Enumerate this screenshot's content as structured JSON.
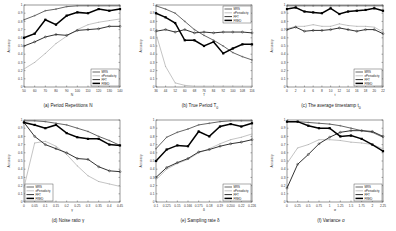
{
  "figure": {
    "legend": [
      "MRS",
      "ePeriodicity",
      "FFT",
      "FRED"
    ],
    "ylabel": "Accuracy"
  },
  "series_styles": [
    {
      "name": "MRS",
      "color": "#555555",
      "width": 0.9,
      "marker": "plus"
    },
    {
      "name": "ePeriodicity",
      "color": "#aaaaaa",
      "width": 0.7,
      "marker": "dot"
    },
    {
      "name": "FFT",
      "color": "#333333",
      "width": 1.0,
      "marker": "circle"
    },
    {
      "name": "FRED",
      "color": "#000000",
      "width": 1.5,
      "marker": "square"
    }
  ],
  "chart_data": [
    {
      "type": "line",
      "title": "(a) Period Repetitions N",
      "xlabel": "N",
      "ylabel": "Accuracy",
      "ylim": [
        0,
        1
      ],
      "legend_position": "lower right",
      "x": [
        50,
        60,
        70,
        80,
        90,
        100,
        110,
        120,
        130,
        140
      ],
      "series": [
        {
          "name": "MRS",
          "values": [
            0.82,
            0.87,
            0.93,
            0.95,
            0.98,
            0.99,
            0.99,
            0.99,
            0.99,
            0.99
          ]
        },
        {
          "name": "ePeriodicity",
          "values": [
            0.22,
            0.3,
            0.41,
            0.53,
            0.62,
            0.7,
            0.76,
            0.79,
            0.81,
            0.83
          ]
        },
        {
          "name": "FFT",
          "values": [
            0.5,
            0.55,
            0.61,
            0.64,
            0.63,
            0.69,
            0.7,
            0.71,
            0.74,
            0.74
          ]
        },
        {
          "name": "FRED",
          "values": [
            0.6,
            0.65,
            0.82,
            0.76,
            0.87,
            0.91,
            0.9,
            0.95,
            0.93,
            0.95
          ]
        }
      ]
    },
    {
      "type": "line",
      "title": "(b) True Period T",
      "title_subscript": "0",
      "xlabel": "T",
      "ylabel": "Accuracy",
      "ylim": [
        0,
        1
      ],
      "legend_position": "upper right",
      "x": [
        36,
        44,
        52,
        60,
        68,
        76,
        84,
        92,
        100,
        108,
        116
      ],
      "series": [
        {
          "name": "MRS",
          "values": [
            0.99,
            0.95,
            0.9,
            0.8,
            0.7,
            0.63,
            0.57,
            0.5,
            0.42,
            0.37,
            0.33
          ]
        },
        {
          "name": "ePeriodicity",
          "values": [
            0.65,
            0.25,
            0.05,
            0.02,
            0.01,
            0.01,
            0.01,
            0.01,
            0.01,
            0.01,
            0.01
          ]
        },
        {
          "name": "FFT",
          "values": [
            0.68,
            0.7,
            0.67,
            0.7,
            0.66,
            0.67,
            0.66,
            0.67,
            0.67,
            0.67,
            0.66
          ]
        },
        {
          "name": "FRED",
          "values": [
            0.9,
            0.85,
            0.78,
            0.57,
            0.57,
            0.5,
            0.55,
            0.41,
            0.47,
            0.52,
            0.52
          ]
        }
      ]
    },
    {
      "type": "line",
      "title": "(c) The average timestamp t",
      "title_subscript": "0",
      "xlabel": "t",
      "ylabel": "Accuracy",
      "ylim": [
        0,
        1
      ],
      "legend_position": "lower right",
      "x": [
        0,
        2,
        4,
        6,
        8,
        10,
        12,
        14,
        16,
        18,
        20,
        22
      ],
      "series": [
        {
          "name": "MRS",
          "values": [
            0.99,
            0.99,
            0.99,
            0.99,
            0.99,
            0.99,
            0.99,
            0.99,
            0.99,
            0.99,
            0.99,
            0.99
          ]
        },
        {
          "name": "ePeriodicity",
          "values": [
            0.71,
            0.74,
            0.74,
            0.76,
            0.74,
            0.74,
            0.77,
            0.75,
            0.74,
            0.74,
            0.73,
            0.67
          ]
        },
        {
          "name": "FFT",
          "values": [
            0.7,
            0.73,
            0.68,
            0.69,
            0.69,
            0.7,
            0.72,
            0.7,
            0.68,
            0.7,
            0.7,
            0.65
          ]
        },
        {
          "name": "FRED",
          "values": [
            0.95,
            0.97,
            0.92,
            0.91,
            0.9,
            0.96,
            0.89,
            0.92,
            0.93,
            0.94,
            0.96,
            0.93
          ]
        }
      ]
    },
    {
      "type": "line",
      "title": "(d) Noise ratio γ",
      "xlabel": "γ",
      "ylabel": "Accuracy",
      "ylim": [
        0,
        1
      ],
      "legend_position": "lower left",
      "x": [
        0,
        0.05,
        0.1,
        0.15,
        0.2,
        0.25,
        0.3,
        0.35,
        0.4,
        0.45
      ],
      "series": [
        {
          "name": "MRS",
          "values": [
            0.99,
            0.99,
            0.98,
            0.96,
            0.94,
            0.9,
            0.86,
            0.8,
            0.75,
            0.69
          ]
        },
        {
          "name": "ePeriodicity",
          "values": [
            0.18,
            0.72,
            0.74,
            0.68,
            0.58,
            0.44,
            0.32,
            0.25,
            0.22,
            0.19
          ]
        },
        {
          "name": "FFT",
          "values": [
            0.97,
            0.8,
            0.7,
            0.65,
            0.6,
            0.53,
            0.52,
            0.43,
            0.38,
            0.37
          ]
        },
        {
          "name": "FRED",
          "values": [
            0.97,
            0.94,
            0.9,
            0.94,
            0.84,
            0.79,
            0.77,
            0.77,
            0.7,
            0.69
          ]
        }
      ]
    },
    {
      "type": "line",
      "title": "(e) Sampling rate δ",
      "xlabel": "δ",
      "ylabel": "Accuracy",
      "ylim": [
        0,
        1
      ],
      "legend_position": "lower right",
      "x": [
        "0.1",
        "0.125",
        "0.15",
        "0.166",
        "0.175",
        "0.18",
        "0.19",
        "0.200",
        "0.22",
        "0.226"
      ],
      "series": [
        {
          "name": "MRS",
          "values": [
            0.65,
            0.79,
            0.85,
            0.89,
            0.94,
            0.96,
            0.98,
            0.99,
            0.99,
            0.99
          ]
        },
        {
          "name": "ePeriodicity",
          "values": [
            0.27,
            0.4,
            0.47,
            0.52,
            0.6,
            0.65,
            0.71,
            0.76,
            0.79,
            0.83
          ]
        },
        {
          "name": "FFT",
          "values": [
            0.3,
            0.42,
            0.48,
            0.53,
            0.61,
            0.64,
            0.68,
            0.71,
            0.73,
            0.76
          ]
        },
        {
          "name": "FRED",
          "values": [
            0.5,
            0.64,
            0.69,
            0.68,
            0.86,
            0.8,
            0.92,
            0.95,
            0.92,
            0.96
          ]
        }
      ]
    },
    {
      "type": "line",
      "title": "(f) Variance σ",
      "xlabel": "σ",
      "ylabel": "Accuracy",
      "ylim": [
        0,
        1
      ],
      "legend_position": "lower right",
      "x": [
        0,
        0.25,
        0.5,
        0.75,
        1,
        1.25,
        1.5,
        1.75,
        2,
        2.25
      ],
      "series": [
        {
          "name": "MRS",
          "values": [
            0.98,
            0.98,
            0.97,
            0.96,
            0.95,
            0.93,
            0.9,
            0.87,
            0.85,
            0.79
          ]
        },
        {
          "name": "ePeriodicity",
          "values": [
            0.47,
            0.66,
            0.7,
            0.76,
            0.76,
            0.75,
            0.73,
            0.72,
            0.7,
            0.65
          ]
        },
        {
          "name": "FFT",
          "values": [
            0.17,
            0.46,
            0.58,
            0.71,
            0.79,
            0.85,
            0.87,
            0.87,
            0.86,
            0.8
          ]
        },
        {
          "name": "FRED",
          "values": [
            0.98,
            0.98,
            0.93,
            0.9,
            0.9,
            0.8,
            0.81,
            0.77,
            0.7,
            0.62
          ]
        }
      ]
    }
  ]
}
